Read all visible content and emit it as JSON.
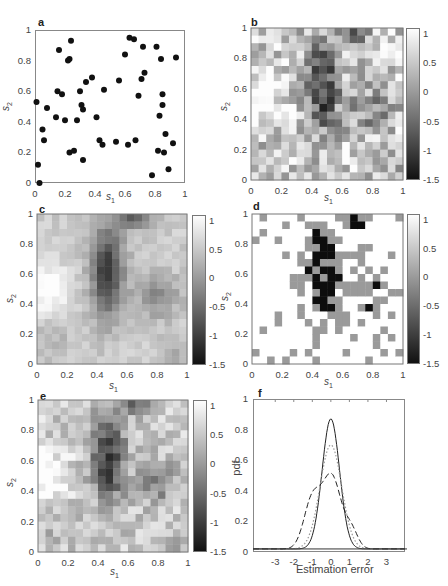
{
  "chart_data": [
    {
      "id": "a",
      "type": "scatter",
      "panel_label": "a",
      "xlabel": "s1",
      "ylabel": "s2",
      "xlim": [
        0,
        1
      ],
      "ylim": [
        0,
        1
      ],
      "xticks": [
        "0",
        "0.2",
        "0.4",
        "0.6",
        "0.8",
        "1"
      ],
      "yticks": [
        "0",
        "0.2",
        "0.4",
        "0.6",
        "0.8",
        "1"
      ],
      "points": [
        [
          0.01,
          0.53
        ],
        [
          0.02,
          0.12
        ],
        [
          0.03,
          0.0
        ],
        [
          0.05,
          0.35
        ],
        [
          0.06,
          0.28
        ],
        [
          0.08,
          0.49
        ],
        [
          0.14,
          0.43
        ],
        [
          0.15,
          0.6
        ],
        [
          0.16,
          0.87
        ],
        [
          0.18,
          0.58
        ],
        [
          0.2,
          0.41
        ],
        [
          0.22,
          0.8
        ],
        [
          0.23,
          0.2
        ],
        [
          0.23,
          0.81
        ],
        [
          0.24,
          0.93
        ],
        [
          0.26,
          0.21
        ],
        [
          0.28,
          0.41
        ],
        [
          0.3,
          0.6
        ],
        [
          0.31,
          0.51
        ],
        [
          0.32,
          0.48
        ],
        [
          0.32,
          0.15
        ],
        [
          0.34,
          0.66
        ],
        [
          0.38,
          0.69
        ],
        [
          0.41,
          0.43
        ],
        [
          0.43,
          0.28
        ],
        [
          0.45,
          0.25
        ],
        [
          0.46,
          0.61
        ],
        [
          0.54,
          0.27
        ],
        [
          0.56,
          0.67
        ],
        [
          0.6,
          0.84
        ],
        [
          0.62,
          0.25
        ],
        [
          0.63,
          0.95
        ],
        [
          0.66,
          0.94
        ],
        [
          0.67,
          0.28
        ],
        [
          0.69,
          0.57
        ],
        [
          0.71,
          0.68
        ],
        [
          0.72,
          0.89
        ],
        [
          0.73,
          0.72
        ],
        [
          0.78,
          0.05
        ],
        [
          0.81,
          0.89
        ],
        [
          0.82,
          0.21
        ],
        [
          0.83,
          0.44
        ],
        [
          0.84,
          0.81
        ],
        [
          0.85,
          0.51
        ],
        [
          0.85,
          0.58
        ],
        [
          0.86,
          0.2
        ],
        [
          0.87,
          0.32
        ],
        [
          0.89,
          0.09
        ],
        [
          0.92,
          0.26
        ],
        [
          0.94,
          0.82
        ]
      ]
    },
    {
      "id": "b",
      "type": "heatmap",
      "panel_label": "b",
      "xlabel": "s1",
      "ylabel": "s2",
      "xlim": [
        0,
        1
      ],
      "ylim": [
        0,
        1
      ],
      "xticks": [
        "0",
        "0.2",
        "0.4",
        "0.6",
        "0.8",
        "1"
      ],
      "yticks": [
        "0",
        "0.2",
        "0.4",
        "0.6",
        "0.8",
        "1"
      ],
      "colorbar": {
        "min": -1.5,
        "max": 1.1,
        "ticks": [
          "1",
          "0.5",
          "0",
          "-0.5",
          "-1",
          "-1.5"
        ]
      },
      "grid_size": 20,
      "description": "Noisy field; dark (low) region centered near s1=0.45-0.55, s2=0.35-0.95, dark band along top at s1 0.6-0.8; bright (high) region left side s1<0.25, s2 0.3-0.9"
    },
    {
      "id": "c",
      "type": "heatmap",
      "panel_label": "c",
      "xlabel": "s1",
      "ylabel": "s2",
      "xlim": [
        0,
        1
      ],
      "ylim": [
        0,
        1
      ],
      "xticks": [
        "0",
        "0.2",
        "0.4",
        "0.6",
        "0.8",
        "1"
      ],
      "yticks": [
        "0",
        "0.2",
        "0.4",
        "0.6",
        "0.8",
        "1"
      ],
      "colorbar": {
        "min": -1.5,
        "max": 1.1,
        "ticks": [
          "1",
          "0.5",
          "0",
          "-0.5",
          "-1",
          "-1.5"
        ]
      },
      "grid_size": 20,
      "description": "Smoothed estimate; vertical dark band around s1~0.45, darkest at top near s1=0.65; bright region at s1<0.2, s2 0.35-0.6"
    },
    {
      "id": "d",
      "type": "heatmap",
      "panel_label": "d",
      "xlabel": "s1",
      "ylabel": "s2",
      "xlim": [
        0,
        1
      ],
      "ylim": [
        0,
        1
      ],
      "xticks": [
        "0",
        "0.2",
        "0.4",
        "0.6",
        "0.8",
        "1"
      ],
      "yticks": [
        "0",
        "0.2",
        "0.4",
        "0.6",
        "0.8",
        "1"
      ],
      "colorbar": {
        "min": -1.5,
        "max": 1.1,
        "ticks": [
          "1",
          "0.5",
          "0",
          "-0.5",
          "-1",
          "-1.5"
        ]
      },
      "grid_size": 20,
      "levels": [
        1.1,
        -0.3,
        -1.5
      ],
      "description": "Three-level classification map (white / grey / black)"
    },
    {
      "id": "e",
      "type": "heatmap",
      "panel_label": "e",
      "xlabel": "s1",
      "ylabel": "s2",
      "xlim": [
        0,
        1
      ],
      "ylim": [
        0,
        1
      ],
      "xticks": [
        "0",
        "0.2",
        "0.4",
        "0.6",
        "0.8",
        "1"
      ],
      "yticks": [
        "0",
        "0.2",
        "0.4",
        "0.6",
        "0.8",
        "1"
      ],
      "colorbar": {
        "min": -1.5,
        "max": 1.1,
        "ticks": [
          "1",
          "0.5",
          "0",
          "-0.5",
          "-1",
          "-1.5"
        ]
      },
      "grid_size": 20,
      "description": "Estimate similar to b but smoother; dark at top s1 0.55-0.75, dark column s1 0.4-0.55"
    },
    {
      "id": "f",
      "type": "line",
      "panel_label": "f",
      "xlabel": "Estimation error",
      "ylabel": "pdf",
      "xlim": [
        -4.2,
        4.0
      ],
      "ylim": [
        0,
        1
      ],
      "xticks": [
        "-3",
        "-2",
        "-1",
        "0",
        "1",
        "2",
        "3"
      ],
      "yticks": [
        "0",
        "0.2",
        "0.4",
        "0.6",
        "0.8",
        "1"
      ],
      "series": [
        {
          "name": "solid",
          "style": "solid",
          "mean": 0.0,
          "sd": 0.47,
          "peak": 0.85
        },
        {
          "name": "dotted",
          "style": "dotted",
          "mean": 0.0,
          "sd": 0.58,
          "peak": 0.68
        },
        {
          "name": "dashed",
          "style": "dashed",
          "components": [
            {
              "mean": -1.0,
              "sd": 0.45,
              "weight": 0.32
            },
            {
              "mean": 0.05,
              "sd": 0.5,
              "weight": 0.47
            },
            {
              "mean": 1.1,
              "sd": 0.35,
              "weight": 0.12
            }
          ],
          "peak": 0.5
        }
      ],
      "baseline": 0.02
    }
  ],
  "panels": {
    "a": {
      "label": "a",
      "xlabel": "s",
      "xsub": "1",
      "ylabel": "s",
      "ysub": "2"
    },
    "b": {
      "label": "b",
      "xlabel": "s",
      "xsub": "1",
      "ylabel": "s",
      "ysub": "2"
    },
    "c": {
      "label": "c",
      "xlabel": "s",
      "xsub": "1",
      "ylabel": "s",
      "ysub": "2"
    },
    "d": {
      "label": "d",
      "xlabel": "s",
      "xsub": "1",
      "ylabel": "s",
      "ysub": "2"
    },
    "e": {
      "label": "e",
      "xlabel": "s",
      "xsub": "1",
      "ylabel": "s",
      "ysub": "2"
    },
    "f": {
      "label": "f",
      "xlabel": "Estimation error",
      "ylabel": "pdf"
    }
  },
  "ticks": {
    "unit": [
      "0",
      "0.2",
      "0.4",
      "0.6",
      "0.8",
      "1"
    ],
    "cbar": [
      "1",
      "0.5",
      "0",
      "-0.5",
      "-1",
      "-1.5"
    ],
    "f_x": [
      "-3",
      "-2",
      "-1",
      "0",
      "1",
      "2",
      "3"
    ]
  }
}
